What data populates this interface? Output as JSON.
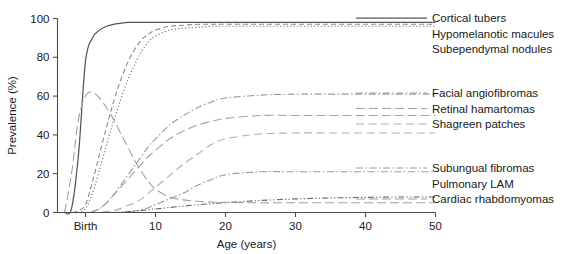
{
  "chart_data": {
    "type": "line",
    "title": "",
    "xlabel": "Age (years)",
    "ylabel": "Prevalence (%)",
    "xlim": [
      -4,
      50
    ],
    "ylim": [
      0,
      100
    ],
    "grid": false,
    "legend_position": "right",
    "x_ticks": [
      {
        "value": 0,
        "label": "Birth"
      },
      {
        "value": 10,
        "label": "10"
      },
      {
        "value": 20,
        "label": "20"
      },
      {
        "value": 30,
        "label": "30"
      },
      {
        "value": 40,
        "label": "40"
      },
      {
        "value": 50,
        "label": "50"
      }
    ],
    "y_ticks": [
      {
        "value": 0,
        "label": "0"
      },
      {
        "value": 20,
        "label": "20"
      },
      {
        "value": 40,
        "label": "40"
      },
      {
        "value": 60,
        "label": "60"
      },
      {
        "value": 80,
        "label": "80"
      },
      {
        "value": 100,
        "label": "100"
      }
    ],
    "x": [
      -3,
      -2,
      -1,
      0,
      1,
      2,
      3,
      4,
      5,
      6,
      7,
      8,
      9,
      10,
      12,
      14,
      16,
      18,
      20,
      25,
      30,
      35,
      40,
      45,
      50
    ],
    "series": [
      {
        "name": "Cortical tubers",
        "style": "solid",
        "color": "#555555",
        "plateau": 98,
        "values": [
          0,
          2,
          30,
          78,
          90,
          94,
          96,
          97,
          97.5,
          98,
          98,
          98,
          98,
          98,
          98,
          98,
          98,
          98,
          98,
          98,
          98,
          98,
          98,
          98,
          98
        ]
      },
      {
        "name": "Hypomelanotic macules",
        "style": "dashed",
        "color": "#8a8a8a",
        "plateau": 97,
        "values": [
          0,
          0,
          1,
          4,
          16,
          30,
          44,
          57,
          68,
          77,
          84,
          89,
          92,
          94,
          96,
          96.5,
          97,
          97,
          97,
          97,
          97,
          97,
          97,
          97,
          97
        ]
      },
      {
        "name": "Subependymal nodules",
        "style": "dotted",
        "color": "#777777",
        "plateau": 96,
        "values": [
          0,
          0,
          0,
          2,
          10,
          22,
          35,
          47,
          58,
          68,
          76,
          83,
          88,
          91,
          94,
          95,
          95.5,
          96,
          96,
          96,
          96,
          96,
          96,
          96,
          96
        ]
      },
      {
        "name": "Facial angiofibromas",
        "style": "dashdot",
        "color": "#9a9a9a",
        "plateau": 61,
        "values": [
          0,
          0,
          0,
          0,
          0.5,
          2,
          5,
          9,
          14,
          19,
          24,
          29,
          34,
          38,
          45,
          50,
          54,
          57,
          59,
          60.5,
          61,
          61,
          61,
          61,
          61
        ]
      },
      {
        "name": "Retinal hamartomas",
        "style": "longdash",
        "color": "#a3a3a3",
        "plateau": 50,
        "values": [
          0,
          0,
          0,
          0,
          0.5,
          2,
          5,
          9,
          13,
          17,
          21,
          25,
          29,
          32,
          38,
          42,
          45,
          47,
          48.5,
          50,
          50,
          50,
          50,
          50,
          50
        ]
      },
      {
        "name": "Shagreen patches",
        "style": "dashed-wide",
        "color": "#adadad",
        "plateau": 41,
        "values": [
          0,
          0,
          0,
          0,
          0,
          0,
          0.5,
          1,
          2,
          3.5,
          5,
          7,
          10,
          13,
          19,
          25,
          30,
          35,
          38,
          40.5,
          41,
          41,
          41,
          41,
          41
        ]
      },
      {
        "name": "Subungual fibromas",
        "style": "dashdot",
        "color": "#9a9a9a",
        "plateau": 21,
        "values": [
          0,
          0,
          0,
          0,
          0,
          0,
          0,
          0,
          0,
          0.3,
          0.8,
          1.5,
          2.5,
          4,
          7,
          10,
          14,
          17,
          19.5,
          21,
          21,
          21,
          21,
          21,
          21
        ]
      },
      {
        "name": "Pulmonary LAM",
        "style": "dashdotdot",
        "color": "#666666",
        "plateau": 8,
        "values": [
          0,
          0,
          0,
          0,
          0,
          0,
          0,
          0,
          0.2,
          0.4,
          0.7,
          1,
          1.4,
          1.8,
          2.6,
          3.3,
          4,
          4.6,
          5.1,
          6.2,
          7,
          7.5,
          7.8,
          8,
          8
        ]
      },
      {
        "name": "Cardiac rhabdomyomas",
        "style": "longdash",
        "color": "#a0a0a0",
        "plateau": 5,
        "values": [
          0,
          20,
          48,
          60,
          62,
          59,
          54,
          48,
          41,
          34,
          27,
          21,
          16,
          12,
          8,
          6.5,
          5.8,
          5.4,
          5.2,
          5,
          5,
          5,
          5,
          5,
          5
        ]
      }
    ]
  },
  "legend": {
    "groups": [
      {
        "items": [
          {
            "label": "Cortical tubers",
            "style": "solid",
            "color": "#555555",
            "show_line": true
          },
          {
            "label": "Hypomelanotic macules",
            "style": "dashed",
            "color": "#8a8a8a",
            "show_line": false
          },
          {
            "label": "Subependymal nodules",
            "style": "dotted",
            "color": "#777777",
            "show_line": false
          }
        ]
      },
      {
        "items": [
          {
            "label": "Facial angiofibromas",
            "style": "dashdot",
            "color": "#9a9a9a",
            "show_line": true
          },
          {
            "label": "Retinal hamartomas",
            "style": "longdash",
            "color": "#a3a3a3",
            "show_line": true
          },
          {
            "label": "Shagreen patches",
            "style": "dashed-wide",
            "color": "#adadad",
            "show_line": true
          }
        ]
      },
      {
        "items": [
          {
            "label": "Subungual fibromas",
            "style": "dashdot",
            "color": "#9a9a9a",
            "show_line": true
          },
          {
            "label": "Pulmonary LAM",
            "style": "dashdotdot",
            "color": "#666666",
            "show_line": false
          },
          {
            "label": "Cardiac rhabdomyomas",
            "style": "longdash",
            "color": "#a0a0a0",
            "show_line": true
          }
        ]
      }
    ]
  }
}
